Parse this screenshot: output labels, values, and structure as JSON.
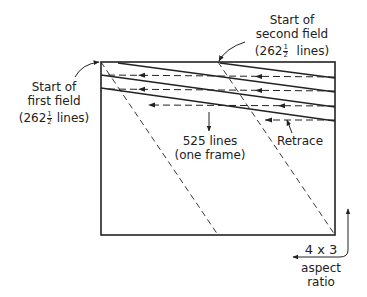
{
  "diagram": {
    "labels": {
      "first_field": {
        "line1": "Start of",
        "line2": "first field",
        "count_prefix": "(262",
        "frac_num": "1",
        "frac_den": "2",
        "count_suffix": " lines)"
      },
      "second_field": {
        "line1": "Start of",
        "line2": "second field",
        "count_prefix": "(262",
        "frac_num": "1",
        "frac_den": "2",
        "count_suffix": "  lines)"
      },
      "frame": {
        "line1": "525 lines",
        "line2": "(one frame)"
      },
      "retrace": "Retrace",
      "aspect": {
        "value": "4 x 3",
        "line1": "aspect",
        "line2": "ratio"
      }
    },
    "colors": {
      "stroke": "#222222",
      "background": "#ffffff"
    }
  }
}
